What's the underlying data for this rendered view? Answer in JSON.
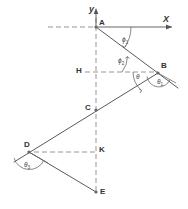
{
  "figure": {
    "type": "geometric-diagram",
    "background_color": "#ffffff",
    "line_color": "#555555",
    "dash_color": "#888888",
    "axes": {
      "y_label": "y",
      "x_label": "X"
    },
    "points": [
      {
        "id": "A",
        "label": "A",
        "x": 96,
        "y": 27
      },
      {
        "id": "B",
        "label": "B",
        "x": 158,
        "y": 73
      },
      {
        "id": "H",
        "label": "H",
        "x": 96,
        "y": 72
      },
      {
        "id": "C",
        "label": "C",
        "x": 96,
        "y": 110
      },
      {
        "id": "D",
        "label": "D",
        "x": 29,
        "y": 152
      },
      {
        "id": "K",
        "label": "K",
        "x": 96,
        "y": 152
      },
      {
        "id": "E",
        "label": "E",
        "x": 96,
        "y": 192
      }
    ],
    "angles": [
      {
        "id": "phi1",
        "label": "ϕ",
        "sub": "1",
        "x": 122,
        "y": 39,
        "vertex": "A"
      },
      {
        "id": "phi2",
        "label": "ϕ",
        "sub": "2",
        "x": 120,
        "y": 62,
        "vertex": "B"
      },
      {
        "id": "theta",
        "label": "θ",
        "sub": "",
        "x": 138,
        "y": 76,
        "vertex": "B"
      },
      {
        "id": "theta1",
        "label": "θ",
        "sub": "1",
        "x": 160,
        "y": 82,
        "vertex": "B"
      },
      {
        "id": "theta3",
        "label": "θ",
        "sub": "3",
        "x": 27,
        "y": 165,
        "vertex": "D"
      }
    ],
    "segments": [
      {
        "id": "A-B",
        "from": "A",
        "to": "B",
        "style": "solid"
      },
      {
        "id": "B-D",
        "from": "B",
        "to": "D",
        "style": "solid"
      },
      {
        "id": "D-E",
        "from": "D",
        "to": "E",
        "style": "solid"
      }
    ],
    "dashed_guides": [
      {
        "id": "x-axis-left",
        "desc": "horizontal dashed through A to the left"
      },
      {
        "id": "y-axis",
        "desc": "vertical dashed axis A-H-C-K-E"
      },
      {
        "id": "H-B",
        "desc": "horizontal dashed from H to B"
      },
      {
        "id": "D-K",
        "desc": "horizontal dashed from D to K"
      }
    ],
    "extensions": [
      {
        "id": "AB-beyond-B",
        "desc": "ray A-B extended past B to lower right"
      },
      {
        "id": "BD-beyond-D",
        "desc": "ray B-D extended past D to lower left"
      }
    ]
  }
}
